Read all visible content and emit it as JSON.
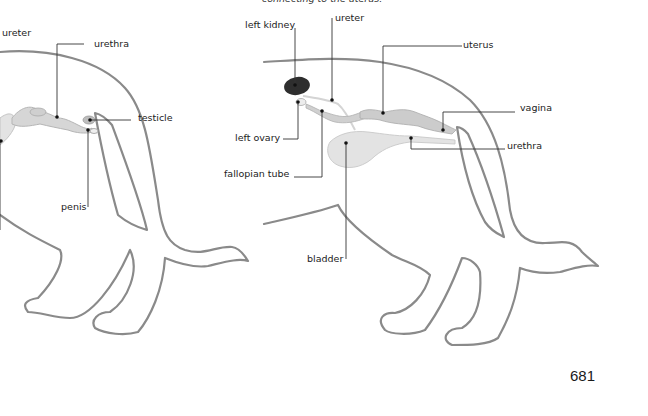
{
  "caption": "connecting to the uterus.",
  "page_number": "681",
  "colors": {
    "outline": "#8a8a8a",
    "organ_fill": "#d6d6d6",
    "organ_stroke": "#b5b5b5",
    "kidney": "#2e2e2e",
    "bladder": "#e3e3e3",
    "leader": "#333333"
  },
  "male_diagram": {
    "labels": {
      "ureter": "ureter",
      "urethra": "urethra",
      "testicle": "testicle",
      "penis": "penis"
    }
  },
  "female_diagram": {
    "labels": {
      "left_kidney": "left kidney",
      "ureter": "ureter",
      "uterus": "uterus",
      "vagina": "vagina",
      "left_ovary": "left ovary",
      "urethra": "urethra",
      "fallopian_tube": "fallopian tube",
      "bladder": "bladder"
    }
  }
}
